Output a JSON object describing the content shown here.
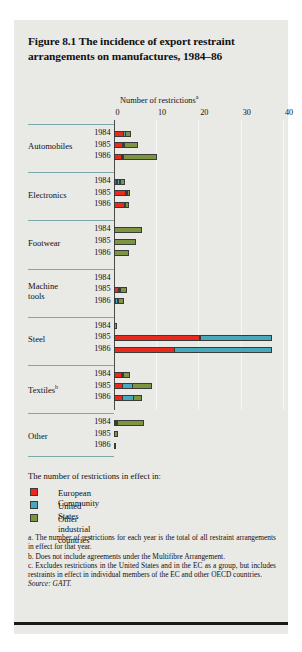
{
  "figure": {
    "title": "Figure 8.1  The incidence of export restraint arrangements on manufactures, 1984–86",
    "axis_title": "Number of restrictions",
    "axis_title_note": "a",
    "legend_heading": "The number of restrictions in effect in:",
    "source": "Source: GATT."
  },
  "legend": [
    {
      "label": "European Community",
      "color": "#e8291c",
      "note": ""
    },
    {
      "label": "United States",
      "color": "#4aa8bd",
      "note": ""
    },
    {
      "label": "Other industrial countries",
      "color": "#7d9440",
      "note": "c"
    }
  ],
  "notes": [
    "a. The number of restrictions for each year is the total of all restraint arrangements in effect for that year.",
    "b. Does not include agreements under the Multifibre Arrangement.",
    "c. Excludes restrictions in the United States and in the EC as a group, but includes restraints in effect in individual members of the EC and other OECD countries."
  ],
  "chart_data": {
    "type": "bar",
    "orientation": "horizontal",
    "stacked": true,
    "title": "Figure 8.1  The incidence of export restraint arrangements on manufactures, 1984–86",
    "xlabel": "Number of restrictions",
    "ylabel": "",
    "xlim": [
      0,
      40
    ],
    "xticks": [
      0,
      10,
      20,
      30,
      40
    ],
    "grid": true,
    "legend_position": "below",
    "series": [
      {
        "name": "European Community",
        "color": "#e8291c"
      },
      {
        "name": "United States",
        "color": "#4aa8bd"
      },
      {
        "name": "Other industrial countries",
        "color": "#7d9440"
      }
    ],
    "categories": [
      "Automobiles",
      "Electronics",
      "Footwear",
      "Machine tools",
      "Steel",
      "Textiles",
      "Other"
    ],
    "category_notes": [
      "",
      "",
      "",
      "",
      "",
      "b",
      ""
    ],
    "years": [
      1984,
      1985,
      1986
    ],
    "groups": [
      {
        "category": "Automobiles",
        "bars": [
          {
            "year": 1984,
            "values": [
              2.5,
              0.5,
              1.5
            ],
            "total": 4.5
          },
          {
            "year": 1985,
            "values": [
              2.3,
              0.4,
              3.3
            ],
            "total": 6.0
          },
          {
            "year": 1986,
            "values": [
              2.0,
              0.4,
              8.1
            ],
            "total": 10.5
          }
        ]
      },
      {
        "category": "Electronics",
        "bars": [
          {
            "year": 1984,
            "values": [
              0.9,
              0.9,
              1.3
            ],
            "total": 3.1
          },
          {
            "year": 1985,
            "values": [
              3.0,
              0.1,
              0.8
            ],
            "total": 3.9
          },
          {
            "year": 1986,
            "values": [
              2.6,
              0.5,
              1.0
            ],
            "total": 4.1
          }
        ]
      },
      {
        "category": "Footwear",
        "bars": [
          {
            "year": 1984,
            "values": [
              0,
              0,
              6.8
            ],
            "total": 6.8
          },
          {
            "year": 1985,
            "values": [
              0,
              0,
              5.2
            ],
            "total": 5.2
          },
          {
            "year": 1986,
            "values": [
              0,
              0,
              3.6
            ],
            "total": 3.6
          }
        ]
      },
      {
        "category": "Machine tools",
        "bars": [
          {
            "year": 1984,
            "values": [
              0,
              0,
              0
            ],
            "total": 0
          },
          {
            "year": 1985,
            "values": [
              1.2,
              0.6,
              1.8
            ],
            "total": 3.6
          },
          {
            "year": 1986,
            "values": [
              0.6,
              0.7,
              1.5
            ],
            "total": 2.8
          }
        ]
      },
      {
        "category": "Steel",
        "bars": [
          {
            "year": 1984,
            "values": [
              0,
              0.8,
              0
            ],
            "total": 0.8
          },
          {
            "year": 1985,
            "values": [
              20.5,
              17.0,
              0
            ],
            "total": 37.5
          },
          {
            "year": 1986,
            "values": [
              14.5,
              23.0,
              0
            ],
            "total": 37.5
          }
        ]
      },
      {
        "category": "Textiles",
        "bars": [
          {
            "year": 1984,
            "values": [
              2.0,
              0.2,
              1.7
            ],
            "total": 3.9
          },
          {
            "year": 1985,
            "values": [
              2.2,
              2.6,
              4.5
            ],
            "total": 9.3
          },
          {
            "year": 1986,
            "values": [
              2.2,
              2.8,
              2.0
            ],
            "total": 7.0
          }
        ]
      },
      {
        "category": "Other",
        "bars": [
          {
            "year": 1984,
            "values": [
              0.6,
              0.4,
              6.5
            ],
            "total": 7.5
          },
          {
            "year": 1985,
            "values": [
              0,
              0,
              1.1
            ],
            "total": 1.1
          },
          {
            "year": 1986,
            "values": [
              0,
              0,
              0.7
            ],
            "total": 0.7
          }
        ]
      }
    ]
  }
}
